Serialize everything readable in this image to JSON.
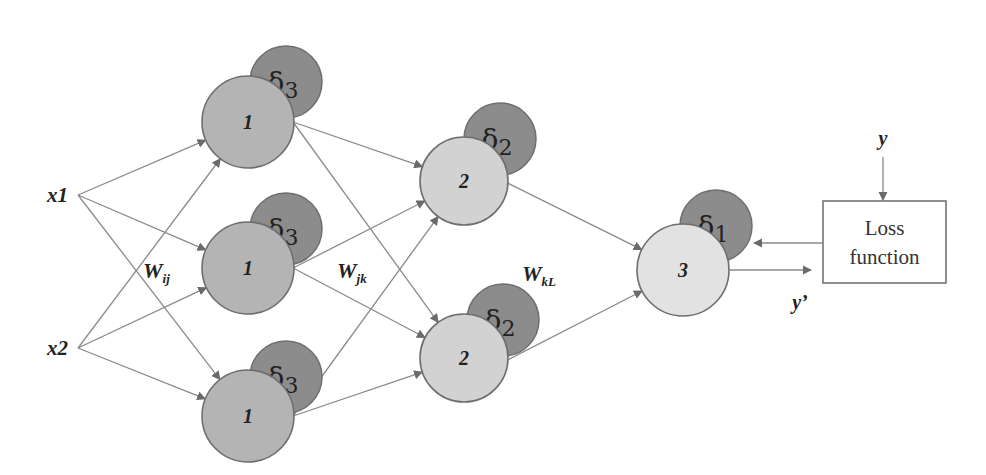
{
  "colors": {
    "layer1_node": "#b4b4b4",
    "layer2_node": "#d2d2d2",
    "output_node": "#e2e2e2",
    "delta_node": "#8c8c8c",
    "stroke": "#6e6e6e",
    "edge": "#8a8a8a",
    "arrow": "#6a6a6a"
  },
  "inputs": [
    {
      "id": "x1",
      "label": "x1",
      "x": 78,
      "y": 195
    },
    {
      "id": "x2",
      "label": "x2",
      "x": 78,
      "y": 348
    }
  ],
  "layer1": {
    "node_label": "1",
    "delta_label": "δ",
    "delta_sub": "3",
    "nodes": [
      {
        "cx": 248,
        "cy": 122,
        "dx": 286,
        "dy": 82
      },
      {
        "cx": 248,
        "cy": 268,
        "dx": 286,
        "dy": 229
      },
      {
        "cx": 248,
        "cy": 416,
        "dx": 286,
        "dy": 377
      }
    ]
  },
  "layer2": {
    "node_label": "2",
    "delta_label": "δ",
    "delta_sub": "2",
    "nodes": [
      {
        "cx": 464,
        "cy": 181,
        "dx": 500,
        "dy": 139
      },
      {
        "cx": 464,
        "cy": 358,
        "dx": 503,
        "dy": 320
      }
    ]
  },
  "output": {
    "node_label": "3",
    "delta_label": "δ",
    "delta_sub": "1",
    "cx": 683,
    "cy": 270,
    "dx": 716,
    "dy": 226
  },
  "weights": {
    "w_ij": {
      "main": "W",
      "sub": "ij",
      "x": 143,
      "y": 278
    },
    "w_jk": {
      "main": "W",
      "sub": "jk",
      "x": 337,
      "y": 278
    },
    "w_kl": {
      "main": "W",
      "sub": "kL",
      "x": 522,
      "y": 281
    }
  },
  "loss_box": {
    "line1": "Loss",
    "line2": "function",
    "x": 823,
    "y": 201,
    "w": 123,
    "h": 82
  },
  "target": {
    "label": "y",
    "x": 883,
    "y": 145
  },
  "prediction": {
    "label": "y’",
    "x": 800,
    "y": 309
  }
}
